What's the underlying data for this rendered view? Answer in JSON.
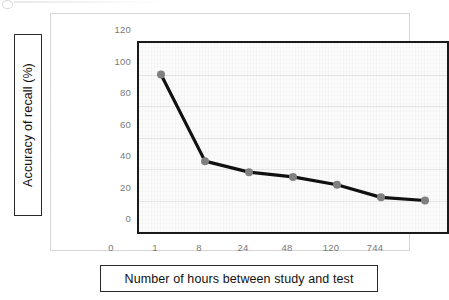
{
  "chart_data": {
    "type": "line",
    "title": "",
    "xlabel": "Number of hours between study and test",
    "ylabel": "Accuracy of recall (%)",
    "categories": [
      "0",
      "1",
      "8",
      "24",
      "48",
      "120",
      "744"
    ],
    "values": [
      100,
      45,
      38,
      35,
      30,
      22,
      20
    ],
    "series": [
      {
        "name": "Accuracy of recall",
        "values": [
          100,
          45,
          38,
          35,
          30,
          22,
          20
        ]
      }
    ],
    "yticks": [
      "0",
      "20",
      "40",
      "60",
      "80",
      "100",
      "120"
    ],
    "ytick_values": [
      0,
      20,
      40,
      60,
      80,
      100,
      120
    ],
    "ylim": [
      0,
      120
    ],
    "grid": true,
    "legend": "none",
    "line_color": "#111111",
    "marker_color": "#808080",
    "plot_border_color": "#1a1a1a",
    "gridline_color": "#e6e6e6",
    "tick_label_color": "#7a7a7a",
    "axis_title_color": "#111111"
  }
}
